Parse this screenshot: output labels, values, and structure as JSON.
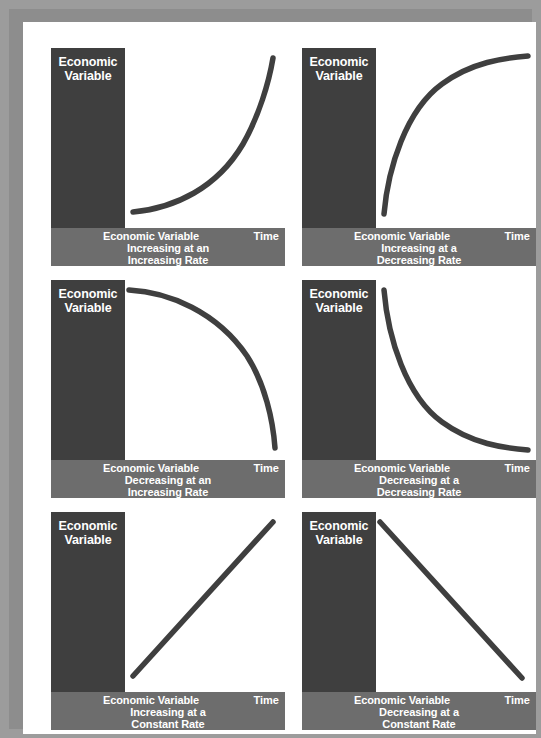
{
  "figure": {
    "background_color": "#9c9c9c",
    "page_color": "#ffffff",
    "axis_block_color": "#3f3f3f",
    "caption_band_color": "#6d6d6d",
    "curve_color": "#3f3f3f",
    "rows": 3,
    "columns": 2
  },
  "chart_data": {
    "type": "line",
    "title": "",
    "xlabel": "Time",
    "ylabel": "Economic Variable",
    "grid": false,
    "legend": "none",
    "xlim": [
      0,
      1
    ],
    "ylim": [
      0,
      1
    ],
    "panels": [
      {
        "id": "increasing-increasing",
        "y_axis_label_line1": "Economic",
        "y_axis_label_line2": "Variable",
        "caption_line1": "Economic Variable",
        "caption_line2": "Increasing at an",
        "caption_line3": "Increasing Rate",
        "x_axis_label": "Time",
        "shape": "convex-increasing",
        "path": "M 8 164 C 50 160, 92 140, 118 96 C 134 68, 144 34, 148 10",
        "x": [
          0.0,
          0.2,
          0.4,
          0.6,
          0.8,
          1.0
        ],
        "y": [
          0.06,
          0.08,
          0.14,
          0.26,
          0.5,
          0.94
        ]
      },
      {
        "id": "increasing-decreasing",
        "y_axis_label_line1": "Economic",
        "y_axis_label_line2": "Variable",
        "caption_line1": "Economic Variable",
        "caption_line2": "Increasing at a",
        "caption_line3": "Decreasing Rate",
        "x_axis_label": "Time",
        "shape": "concave-increasing",
        "path": "M 8 166 C 12 120, 30 62, 66 36 C 96 14, 128 10, 152 8",
        "x": [
          0.0,
          0.2,
          0.4,
          0.6,
          0.8,
          1.0
        ],
        "y": [
          0.06,
          0.46,
          0.7,
          0.84,
          0.92,
          0.96
        ]
      },
      {
        "id": "decreasing-increasing",
        "y_axis_label_line1": "Economic",
        "y_axis_label_line2": "Variable",
        "caption_line1": "Economic Variable",
        "caption_line2": "Decreasing at an",
        "caption_line3": "Increasing Rate",
        "x_axis_label": "Time",
        "shape": "concave-decreasing",
        "path": "M 4 10 C 44 12, 92 32, 122 76 C 140 104, 148 140, 150 168",
        "x": [
          0.0,
          0.2,
          0.4,
          0.6,
          0.8,
          1.0
        ],
        "y": [
          0.95,
          0.92,
          0.84,
          0.7,
          0.46,
          0.06
        ]
      },
      {
        "id": "decreasing-decreasing",
        "y_axis_label_line1": "Economic",
        "y_axis_label_line2": "Variable",
        "caption_line1": "Economic Variable",
        "caption_line2": "Decreasing at a",
        "caption_line3": "Decreasing Rate",
        "x_axis_label": "Time",
        "shape": "convex-decreasing",
        "path": "M 8 10 C 12 58, 30 116, 66 142 C 96 164, 128 168, 152 170",
        "x": [
          0.0,
          0.2,
          0.4,
          0.6,
          0.8,
          1.0
        ],
        "y": [
          0.95,
          0.54,
          0.3,
          0.17,
          0.09,
          0.05
        ]
      },
      {
        "id": "increasing-constant",
        "y_axis_label_line1": "Economic",
        "y_axis_label_line2": "Variable",
        "caption_line1": "Economic Variable",
        "caption_line2": "Increasing at a",
        "caption_line3": "Constant Rate",
        "x_axis_label": "Time",
        "shape": "linear-increasing",
        "path": "M 8 164 L 148 10",
        "x": [
          0.0,
          0.25,
          0.5,
          0.75,
          1.0
        ],
        "y": [
          0.06,
          0.28,
          0.5,
          0.72,
          0.94
        ]
      },
      {
        "id": "decreasing-constant",
        "y_axis_label_line1": "Economic",
        "y_axis_label_line2": "Variable",
        "caption_line1": "Economic Variable",
        "caption_line2": "Decreasing at a",
        "caption_line3": "Constant Rate",
        "x_axis_label": "Time",
        "shape": "linear-decreasing",
        "path": "M 4 10 L 146 166",
        "x": [
          0.0,
          0.25,
          0.5,
          0.75,
          1.0
        ],
        "y": [
          0.94,
          0.72,
          0.5,
          0.28,
          0.06
        ]
      }
    ]
  }
}
